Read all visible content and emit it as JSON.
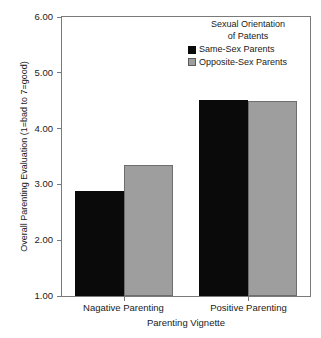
{
  "chart_data": {
    "type": "bar",
    "title": "",
    "xlabel": "Parenting Vignette",
    "ylabel": "Overall Parenting Evaluation (1=bad to 7=good)",
    "categories": [
      "Nagative Parenting",
      "Positive Parenting"
    ],
    "series": [
      {
        "name": "Same-Sex Parents",
        "color": "#0a0a0a",
        "values": [
          2.88,
          4.52
        ]
      },
      {
        "name": "Opposite-Sex Parents",
        "color": "#9e9e9e",
        "values": [
          3.34,
          4.5
        ]
      }
    ],
    "ylim": [
      1.0,
      6.0
    ],
    "yticks": [
      1.0,
      2.0,
      3.0,
      4.0,
      5.0,
      6.0
    ],
    "ytick_labels": [
      "1.00",
      "2.00",
      "3.00",
      "4.00",
      "5.00",
      "6.00"
    ],
    "grid": false,
    "legend_position": "top-right",
    "legend": {
      "title_line1": "Sexual Orientation",
      "title_line2": "of Patents",
      "entries": [
        "Same-Sex Parents",
        "Opposite-Sex Parents"
      ]
    }
  }
}
